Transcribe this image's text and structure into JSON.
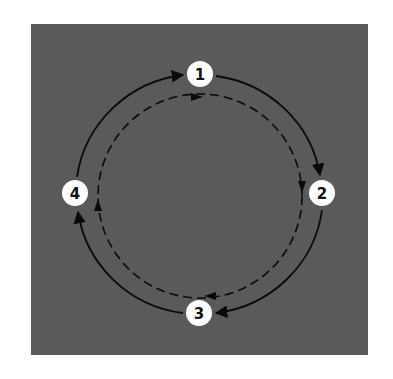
{
  "diagram": {
    "type": "cycle",
    "direction": "clockwise",
    "colors": {
      "page_background": "#ffffff",
      "panel_background": "#5a5a5a",
      "line": "#0a0a0a",
      "node_fill": "#ffffff",
      "node_text": "#111111"
    },
    "panel": {
      "x": 31,
      "y": 24,
      "width": 337,
      "height": 331
    },
    "nodes": [
      {
        "id": "1",
        "label": "1",
        "x": 200,
        "y": 74
      },
      {
        "id": "2",
        "label": "2",
        "x": 322,
        "y": 193
      },
      {
        "id": "3",
        "label": "3",
        "x": 199,
        "y": 313
      },
      {
        "id": "4",
        "label": "4",
        "x": 75,
        "y": 193
      }
    ],
    "outer_cycle": {
      "style": "solid",
      "edges": [
        {
          "from": "1",
          "to": "2"
        },
        {
          "from": "2",
          "to": "3"
        },
        {
          "from": "3",
          "to": "4"
        },
        {
          "from": "4",
          "to": "1"
        }
      ]
    },
    "inner_cycle": {
      "style": "dashed",
      "center": {
        "x": 200,
        "y": 196
      },
      "radius": 102,
      "arrow_directions": [
        "right",
        "down",
        "left",
        "up"
      ]
    }
  }
}
